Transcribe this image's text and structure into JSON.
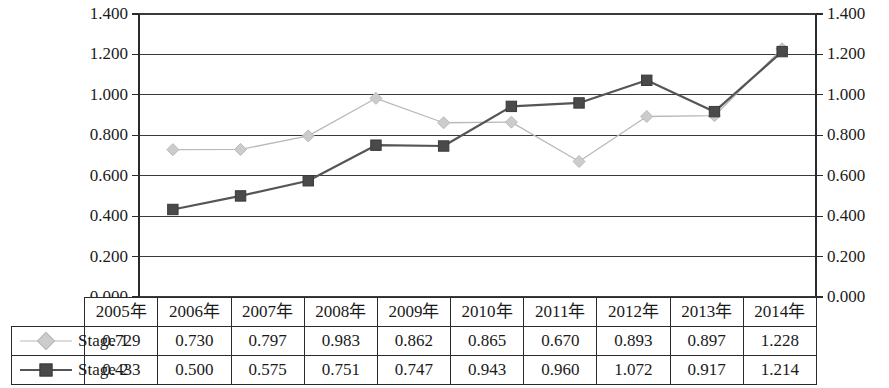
{
  "chart_data": {
    "type": "line",
    "title": "",
    "subtitle": "",
    "xlabel": "",
    "ylabel": "",
    "categories": [
      "2005年",
      "2006年",
      "2007年",
      "2008年",
      "2009年",
      "2010年",
      "2011年",
      "2012年",
      "2013年",
      "2014年"
    ],
    "series": [
      {
        "name": "Stage 1",
        "values": [
          0.729,
          0.73,
          0.797,
          0.983,
          0.862,
          0.865,
          0.67,
          0.893,
          0.897,
          1.228
        ],
        "color": "#b9b9b9",
        "marker": "diamond",
        "line_width": 1.3
      },
      {
        "name": "Stage 2",
        "values": [
          0.433,
          0.5,
          0.575,
          0.751,
          0.747,
          0.943,
          0.96,
          1.072,
          0.917,
          1.214
        ],
        "color": "#555555",
        "marker": "square",
        "line_width": 2.2
      }
    ],
    "ylim": [
      0.0,
      1.4
    ],
    "ytick_step": 0.2,
    "ytick_labels": [
      "1.400",
      "1.200",
      "1.000",
      "0.800",
      "0.600",
      "0.400",
      "0.200",
      "0.000"
    ],
    "ytick_values": [
      1.4,
      1.2,
      1.0,
      0.8,
      0.6,
      0.4,
      0.2,
      0.0
    ],
    "grid": true,
    "grid_axis": "y",
    "dual_y_axis": true,
    "left_axis_labels": [
      "1.400",
      "1.200",
      "1.000",
      "0.800",
      "0.600",
      "0.400",
      "0.200",
      "0.000"
    ],
    "right_axis_labels": [
      "1.400",
      "1.200",
      "1.000",
      "0.800",
      "0.600",
      "0.400",
      "0.200",
      "0.000"
    ],
    "legend_position": "data-table",
    "axis_color": "#2b2b2b",
    "grid_color": "#3a3a3a",
    "background": "#ffffff"
  },
  "data_table": {
    "header_corner": "",
    "columns": [
      "2005年",
      "2006年",
      "2007年",
      "2008年",
      "2009年",
      "2010年",
      "2011年",
      "2012年",
      "2013年",
      "2014年"
    ],
    "rows": [
      {
        "label": "Stage 1",
        "marker": "diamond",
        "color": "#b9b9b9",
        "values": [
          "0.729",
          "0.730",
          "0.797",
          "0.983",
          "0.862",
          "0.865",
          "0.670",
          "0.893",
          "0.897",
          "1.228"
        ]
      },
      {
        "label": "Stage 2",
        "marker": "square",
        "color": "#555555",
        "values": [
          "0.433",
          "0.500",
          "0.575",
          "0.751",
          "0.747",
          "0.943",
          "0.960",
          "1.072",
          "0.917",
          "1.214"
        ]
      }
    ]
  }
}
